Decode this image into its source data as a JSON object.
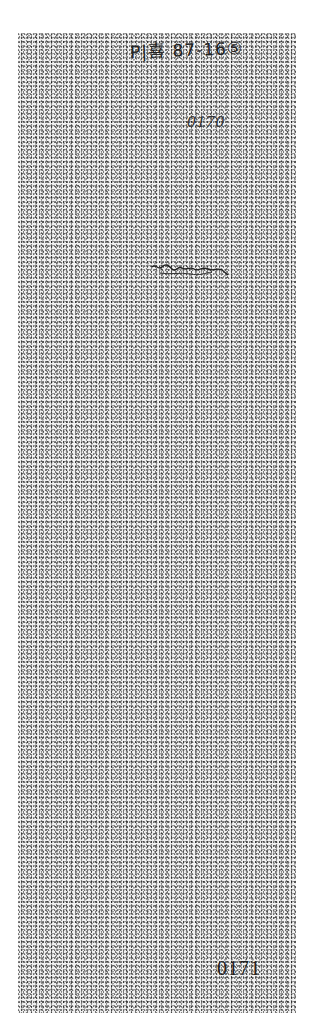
{
  "document": {
    "handwritten_reference": "P|喜 87-16⑤",
    "stamped_number_top": "0170",
    "signature": "illegible signature",
    "page_number": "0171"
  }
}
